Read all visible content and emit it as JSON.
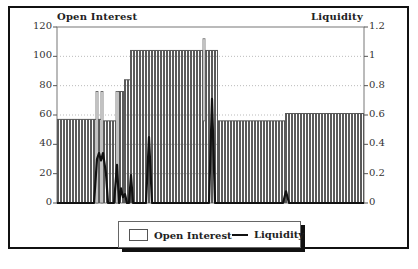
{
  "chart_data": {
    "type": "bar",
    "title": "",
    "left_axis": {
      "label": "Open Interest",
      "ylim": [
        0,
        120
      ],
      "ticks": [
        0,
        20,
        40,
        60,
        80,
        100,
        120
      ]
    },
    "right_axis": {
      "label": "Liquidity",
      "ylim": [
        0,
        1.2
      ],
      "ticks": [
        "0",
        "0.2",
        "0.4",
        "0.6",
        "0.8",
        "1",
        "1.2"
      ]
    },
    "grid": "dotted horizontal at left-axis ticks",
    "legend": {
      "position": "bottom-center",
      "entries": [
        "Open Interest",
        "Liquidity"
      ]
    },
    "series": [
      {
        "name": "Open Interest",
        "type": "bar",
        "segments": [
          {
            "x_start_px": 57,
            "x_end_px": 96,
            "value": 57
          },
          {
            "x_start_px": 96,
            "x_end_px": 98,
            "value": 76
          },
          {
            "x_start_px": 98,
            "x_end_px": 101,
            "value": 57
          },
          {
            "x_start_px": 101,
            "x_end_px": 103,
            "value": 76
          },
          {
            "x_start_px": 103,
            "x_end_px": 116,
            "value": 56
          },
          {
            "x_start_px": 116,
            "x_end_px": 124,
            "value": 76
          },
          {
            "x_start_px": 124,
            "x_end_px": 130,
            "value": 84
          },
          {
            "x_start_px": 130,
            "x_end_px": 218,
            "value": 104
          },
          {
            "x_start_px": 218,
            "x_end_px": 285,
            "value": 56
          },
          {
            "x_start_px": 285,
            "x_end_px": 364,
            "value": 61
          }
        ],
        "outliers": [
          {
            "x_px": 203,
            "value": 112
          }
        ]
      },
      {
        "name": "Liquidity",
        "type": "line",
        "points_px_value": [
          [
            57,
            0
          ],
          [
            94,
            0
          ],
          [
            97,
            0.3
          ],
          [
            99,
            0.34
          ],
          [
            101,
            0.29
          ],
          [
            103,
            0.34
          ],
          [
            106,
            0.2
          ],
          [
            108,
            0
          ],
          [
            114,
            0
          ],
          [
            117,
            0.26
          ],
          [
            119,
            0
          ],
          [
            121,
            0.1
          ],
          [
            123,
            0.04
          ],
          [
            125,
            0.06
          ],
          [
            127,
            0
          ],
          [
            129,
            0
          ],
          [
            131,
            0.19
          ],
          [
            133,
            0
          ],
          [
            146,
            0
          ],
          [
            149,
            0.45
          ],
          [
            152,
            0
          ],
          [
            209,
            0
          ],
          [
            212,
            0.71
          ],
          [
            215,
            0
          ],
          [
            283,
            0
          ],
          [
            286,
            0.08
          ],
          [
            289,
            0
          ],
          [
            364,
            0
          ]
        ]
      }
    ]
  },
  "labels": {
    "left_title": "Open Interest",
    "right_title": "Liquidity",
    "left_ticks": [
      "120",
      "100",
      "80",
      "60",
      "40",
      "20",
      "0"
    ],
    "right_ticks": [
      "1.2",
      "1",
      "0.8",
      "0.6",
      "0.4",
      "0.2",
      "0"
    ]
  },
  "legend": {
    "open_interest": "Open Interest",
    "liquidity": "Liquidity"
  },
  "colors": {
    "bar_fill": "#555555",
    "line": "#111111",
    "frame": "#111111"
  }
}
